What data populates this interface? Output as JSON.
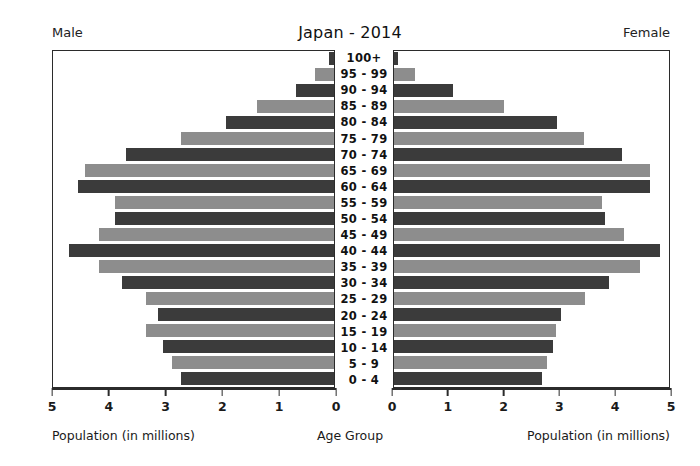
{
  "header": {
    "title": "Japan - 2014",
    "left_side_label": "Male",
    "right_side_label": "Female"
  },
  "axis": {
    "left_caption": "Population (in millions)",
    "center_caption": "Age Group",
    "right_caption": "Population (in millions)",
    "left_ticks": [
      "5",
      "4",
      "3",
      "2",
      "1",
      "0"
    ],
    "right_ticks": [
      "0",
      "1",
      "2",
      "3",
      "4",
      "5"
    ]
  },
  "colors": {
    "bar_light": "#8d8d8d",
    "bar_dark": "#3b3b3b",
    "frame": "#2b2b2b",
    "background": "#ffffff",
    "text": "#1a1a1a"
  },
  "chart_data": {
    "type": "bar",
    "subtype": "population-pyramid",
    "title": "Japan - 2014",
    "xlabel": "Population (in millions)",
    "ylabel": "Age Group",
    "xlim": [
      0,
      5
    ],
    "grid": false,
    "legend": "none",
    "orientation": "horizontal",
    "categories": [
      "0 - 4",
      "5 - 9",
      "10 - 14",
      "15 - 19",
      "20 - 24",
      "25 - 29",
      "30 - 34",
      "35 - 39",
      "40 - 44",
      "45 - 49",
      "50 - 54",
      "55 - 59",
      "60 - 64",
      "65 - 69",
      "70 - 74",
      "75 - 79",
      "80 - 84",
      "85 - 89",
      "90 - 94",
      "95 - 99",
      "100+"
    ],
    "series": [
      {
        "name": "Male",
        "side": "left",
        "values": [
          2.73,
          2.89,
          3.04,
          3.34,
          3.13,
          3.34,
          3.77,
          4.18,
          4.71,
          4.18,
          3.89,
          3.89,
          4.55,
          4.43,
          3.71,
          2.73,
          1.93,
          1.37,
          0.67,
          0.34,
          0.09
        ]
      },
      {
        "name": "Female",
        "side": "right",
        "values": [
          2.69,
          2.78,
          2.89,
          2.94,
          3.03,
          3.47,
          3.9,
          4.47,
          4.83,
          4.19,
          3.84,
          3.79,
          4.65,
          4.65,
          4.15,
          3.46,
          2.96,
          2.0,
          1.08,
          0.38,
          0.07
        ]
      }
    ],
    "bar_shading": [
      "dark",
      "light",
      "dark",
      "light",
      "dark",
      "light",
      "dark",
      "light",
      "dark",
      "light",
      "dark",
      "light",
      "dark",
      "light",
      "dark",
      "light",
      "dark",
      "light",
      "dark",
      "light",
      "dark"
    ]
  }
}
